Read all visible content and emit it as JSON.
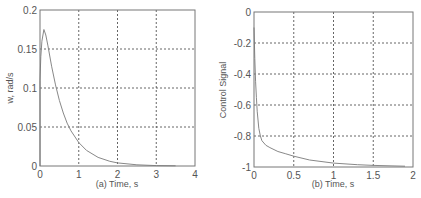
{
  "chart_data": [
    {
      "type": "line",
      "title": "",
      "xlabel": "(a) Time, s",
      "ylabel": "w, rad/s",
      "xlim": [
        0,
        4
      ],
      "ylim": [
        0,
        0.2
      ],
      "xticks": [
        "0",
        "1",
        "2",
        "3",
        "4"
      ],
      "yticks": [
        "0",
        "0.05",
        "0.1",
        "0.15",
        "0.2"
      ],
      "grid": true,
      "series": [
        {
          "name": "w",
          "x": [
            0,
            0,
            0.02,
            0.05,
            0.1,
            0.15,
            0.2,
            0.3,
            0.4,
            0.5,
            0.6,
            0.7,
            0.8,
            1.0,
            1.2,
            1.5,
            1.8,
            2.0,
            2.5,
            3.0,
            3.5
          ],
          "values": [
            0,
            0.11,
            0.14,
            0.16,
            0.175,
            0.168,
            0.155,
            0.128,
            0.104,
            0.084,
            0.068,
            0.055,
            0.045,
            0.03,
            0.02,
            0.011,
            0.006,
            0.004,
            0.0015,
            0.0005,
            0.0002
          ]
        }
      ]
    },
    {
      "type": "line",
      "title": "",
      "xlabel": "(b) Time, s",
      "ylabel": "Control Signal",
      "xlim": [
        0,
        2
      ],
      "ylim": [
        -1,
        0
      ],
      "xticks": [
        "0",
        "0.5",
        "1",
        "1.5",
        "2"
      ],
      "yticks": [
        "-1",
        "-0.8",
        "-0.6",
        "-0.4",
        "-0.2",
        "0"
      ],
      "grid": true,
      "series": [
        {
          "name": "control signal",
          "x": [
            0,
            0.01,
            0.02,
            0.03,
            0.04,
            0.06,
            0.08,
            0.1,
            0.15,
            0.2,
            0.3,
            0.4,
            0.5,
            0.7,
            1.0,
            1.3,
            1.5,
            1.9
          ],
          "values": [
            -0.1,
            -0.3,
            -0.45,
            -0.55,
            -0.64,
            -0.75,
            -0.8,
            -0.83,
            -0.86,
            -0.875,
            -0.9,
            -0.915,
            -0.93,
            -0.955,
            -0.975,
            -0.985,
            -0.99,
            -0.995
          ]
        }
      ]
    }
  ],
  "plots": {
    "left": {
      "xlabel": "(a) Time, s",
      "ylabel": "w, rad/s",
      "xticks": [
        "0",
        "1",
        "2",
        "3",
        "4"
      ],
      "yticks": [
        "0",
        "0.05",
        "0.1",
        "0.15",
        "0.2"
      ]
    },
    "right": {
      "xlabel": "(b) Time, s",
      "ylabel": "Control Signal",
      "xticks": [
        "0",
        "0.5",
        "1",
        "1.5",
        "2"
      ],
      "yticks": [
        "-1",
        "-0.8",
        "-0.6",
        "-0.4",
        "-0.2",
        "0"
      ]
    }
  }
}
